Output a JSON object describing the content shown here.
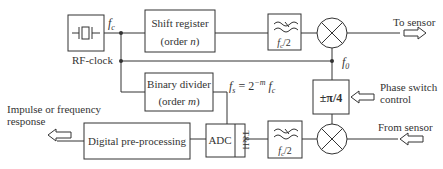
{
  "diagram": {
    "blocks": {
      "rf_clock": {
        "label": "RF-clock",
        "signal": "f_c"
      },
      "shift_register": {
        "line1": "Shift register",
        "line2_prefix": "(order ",
        "line2_var": "n",
        "line2_suffix": ")"
      },
      "lowpass_top": {
        "label": "f_c/2",
        "label_var": "f",
        "label_sub": "c",
        "label_rest": "/2"
      },
      "binary_divider": {
        "line1": "Binary divider",
        "line2_prefix": "(order ",
        "line2_var": "m",
        "line2_suffix": ")"
      },
      "phase_switch": {
        "label": "±π/4"
      },
      "adc": {
        "label": "ADC",
        "th_label": "T&H"
      },
      "lowpass_bottom": {
        "label_var": "f",
        "label_sub": "c",
        "label_rest": "/2"
      },
      "digital_preproc": {
        "label": "Digital pre-processing"
      }
    },
    "labels": {
      "fc": "f",
      "fc_sub": "c",
      "f0": "f",
      "f0_sub": "0",
      "fs_eq": "f",
      "fs_sub": "s",
      "fs_eq_mid": " = 2",
      "fs_exp": "−m",
      "fs_tail": " f",
      "fs_tail_sub": "c",
      "to_sensor": "To sensor",
      "phase_switch_line1": "Phase switch",
      "phase_switch_line2": "control",
      "from_sensor": "From sensor",
      "output_line1": "Impulse or frequency",
      "output_line2": "response"
    },
    "colors": {
      "stroke": "#333333",
      "background": "#ffffff"
    }
  }
}
